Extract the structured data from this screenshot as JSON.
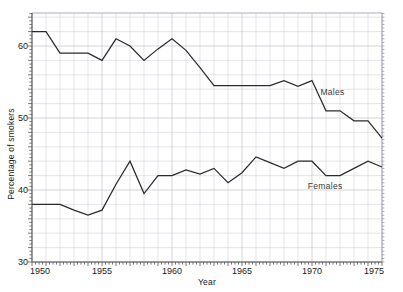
{
  "chart_data": {
    "type": "line",
    "title": "",
    "subtitle": "",
    "xlabel": "Year",
    "ylabel": "Percentage of smokers",
    "xlim": [
      1950,
      1975
    ],
    "ylim": [
      30,
      65
    ],
    "grid": true,
    "legend_position": "inline-annotation",
    "x_ticks": [
      1950,
      1955,
      1960,
      1965,
      1970,
      1975
    ],
    "x_tick_labels": [
      "1950",
      "1955",
      "1960",
      "1965",
      "1970",
      "1975"
    ],
    "y_ticks": [
      30,
      40,
      50,
      60
    ],
    "y_tick_labels": [
      "30",
      "40",
      "50",
      "60"
    ],
    "y_minor_step": 2,
    "x_minor_step": 1,
    "x": [
      1950,
      1951,
      1952,
      1953,
      1954,
      1955,
      1956,
      1957,
      1958,
      1959,
      1960,
      1961,
      1962,
      1963,
      1964,
      1965,
      1966,
      1967,
      1968,
      1969,
      1970,
      1971,
      1972,
      1973,
      1974,
      1975
    ],
    "series": [
      {
        "name": "Males",
        "label": "Males",
        "color": "#2b2b2b",
        "label_x": 1970.6,
        "label_y": 53.2,
        "values": [
          62.0,
          62.0,
          59.0,
          59.0,
          59.0,
          58.0,
          61.0,
          60.0,
          58.0,
          59.6,
          61.0,
          59.4,
          57.0,
          54.5,
          54.5,
          54.5,
          54.5,
          54.5,
          55.2,
          54.4,
          55.2,
          51.0,
          51.0,
          49.6,
          49.6,
          47.2
        ]
      },
      {
        "name": "Females",
        "label": "Females",
        "color": "#2b2b2b",
        "label_x": 1969.7,
        "label_y": 40.2,
        "values": [
          38.0,
          38.0,
          38.0,
          37.2,
          36.5,
          37.2,
          40.8,
          44.0,
          39.5,
          42.0,
          42.0,
          42.8,
          42.2,
          43.0,
          41.0,
          42.4,
          44.6,
          43.8,
          43.0,
          44.0,
          44.0,
          42.0,
          42.0,
          43.0,
          44.0,
          43.2
        ]
      }
    ]
  }
}
